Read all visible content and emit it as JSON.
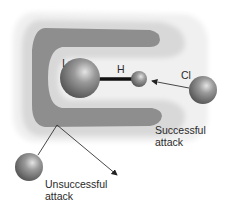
{
  "diagram": {
    "atoms": {
      "iodine": {
        "label": "I"
      },
      "hydrogen": {
        "label": "H"
      },
      "chlorine": {
        "label": "Cl"
      }
    },
    "annotations": {
      "successful": {
        "line1": "Successful",
        "line2": "attack"
      },
      "unsuccessful": {
        "line1": "Unsuccessful",
        "line2": "attack"
      }
    },
    "colors": {
      "outer_halo": "#efefef",
      "mid_band": "#d6d6d6",
      "dark_band": "#8c8c8c",
      "sphere": "#6e6e6e",
      "bond": "#111111"
    }
  }
}
